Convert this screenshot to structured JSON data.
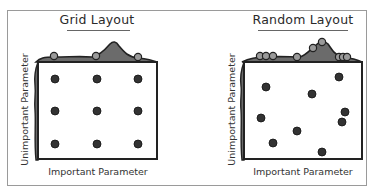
{
  "panels": [
    {
      "title": "Grid Layout",
      "xlabel": "Important Parameter",
      "ylabel": "Unimportant Parameter",
      "points": [
        [
          55,
          79
        ],
        [
          97,
          79
        ],
        [
          138,
          79
        ],
        [
          55,
          111
        ],
        [
          97,
          111
        ],
        [
          138,
          111
        ],
        [
          55,
          144
        ],
        [
          97,
          144
        ],
        [
          138,
          144
        ]
      ],
      "top_marginal_points": [
        54,
        96,
        138
      ]
    },
    {
      "title": "Random Layout",
      "xlabel": "Important Parameter",
      "ylabel": "Unimportant Parameter",
      "points": [
        [
          266,
          87
        ],
        [
          312,
          94
        ],
        [
          339,
          77
        ],
        [
          261,
          118
        ],
        [
          345,
          112
        ],
        [
          342,
          122
        ],
        [
          297,
          131
        ],
        [
          273,
          143
        ],
        [
          322,
          152
        ]
      ],
      "top_marginal_points": [
        261,
        266,
        273,
        297,
        312,
        322,
        339,
        342,
        345
      ]
    }
  ],
  "colors": {
    "frame": "#9a9a9a",
    "dot": "#333333",
    "density_fill": "#6b6b6b",
    "box_stroke": "#222222"
  }
}
